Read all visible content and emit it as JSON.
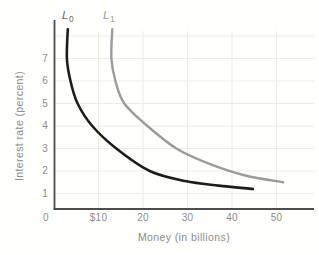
{
  "chart_data": {
    "type": "line",
    "title": "",
    "xlabel": "Money (in billions)",
    "ylabel": "Interest rate (percent)",
    "xlim": [
      0,
      58.4
    ],
    "ylim": [
      0,
      8.4
    ],
    "grid": true,
    "legend_position": "curve-end-labels-top",
    "x_ticks": [
      {
        "value": 0,
        "label": "0"
      },
      {
        "value": 10,
        "label": "$10"
      },
      {
        "value": 20,
        "label": "20"
      },
      {
        "value": 30,
        "label": "30"
      },
      {
        "value": 40,
        "label": "40"
      },
      {
        "value": 50,
        "label": "50"
      }
    ],
    "y_ticks": [
      {
        "value": 1,
        "label": "1"
      },
      {
        "value": 2,
        "label": "2"
      },
      {
        "value": 3,
        "label": "3"
      },
      {
        "value": 4,
        "label": "4"
      },
      {
        "value": 5,
        "label": "5"
      },
      {
        "value": 6,
        "label": "6"
      },
      {
        "value": 7,
        "label": "7"
      }
    ],
    "x_grid_values": [
      10,
      20,
      30,
      40,
      50
    ],
    "y_grid_values": [
      1,
      2,
      3,
      4,
      5,
      6,
      7,
      8
    ],
    "series": [
      {
        "name": "L0",
        "label_main": "L",
        "label_sub": "0",
        "color": "#1c1c1c",
        "stroke_width": 2.6,
        "points": [
          [
            3.1,
            8.3
          ],
          [
            2.9,
            7.0
          ],
          [
            3.7,
            6.0
          ],
          [
            5.3,
            5.0
          ],
          [
            8.6,
            4.0
          ],
          [
            14.0,
            3.0
          ],
          [
            21.5,
            2.0
          ],
          [
            29.5,
            1.55
          ],
          [
            37.0,
            1.35
          ],
          [
            44.7,
            1.2
          ]
        ]
      },
      {
        "name": "L1",
        "label_main": "L",
        "label_sub": "1",
        "color": "#9b9b9b",
        "stroke_width": 2.4,
        "points": [
          [
            13.1,
            8.3
          ],
          [
            12.9,
            7.0
          ],
          [
            13.8,
            6.0
          ],
          [
            15.8,
            5.0
          ],
          [
            21.0,
            4.0
          ],
          [
            27.5,
            3.0
          ],
          [
            34.5,
            2.35
          ],
          [
            43.0,
            1.8
          ],
          [
            51.5,
            1.5
          ]
        ]
      }
    ],
    "colors": {
      "axis": "#4d4d4d",
      "grid": "#efece4",
      "tick_text": "#8c8c8c"
    }
  }
}
